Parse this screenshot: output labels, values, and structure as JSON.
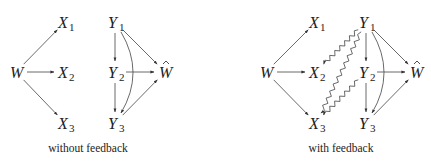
{
  "figure": {
    "panels": [
      {
        "id": "without-feedback",
        "caption": "without feedback",
        "caption_pos": [
          88,
          152
        ],
        "nodes": [
          {
            "id": "W",
            "base": "W",
            "sub": "",
            "hat": false,
            "x": 16,
            "y": 72
          },
          {
            "id": "X1",
            "base": "X",
            "sub": "1",
            "hat": false,
            "x": 65,
            "y": 22
          },
          {
            "id": "X2",
            "base": "X",
            "sub": "2",
            "hat": false,
            "x": 65,
            "y": 72
          },
          {
            "id": "X3",
            "base": "X",
            "sub": "3",
            "hat": false,
            "x": 65,
            "y": 123
          },
          {
            "id": "Y1",
            "base": "Y",
            "sub": "1",
            "hat": false,
            "x": 115,
            "y": 22
          },
          {
            "id": "Y2",
            "base": "Y",
            "sub": "2",
            "hat": false,
            "x": 115,
            "y": 72
          },
          {
            "id": "Y3",
            "base": "Y",
            "sub": "3",
            "hat": false,
            "x": 115,
            "y": 123
          },
          {
            "id": "What",
            "base": "W",
            "sub": "",
            "hat": true,
            "x": 165,
            "y": 72
          }
        ],
        "edges": [
          {
            "from": "W",
            "to": "X1",
            "style": "straight"
          },
          {
            "from": "W",
            "to": "X2",
            "style": "straight"
          },
          {
            "from": "W",
            "to": "X3",
            "style": "straight"
          },
          {
            "from": "Y1",
            "to": "Y2",
            "style": "straight"
          },
          {
            "from": "Y1",
            "to": "What",
            "style": "straight"
          },
          {
            "from": "Y1",
            "to": "Y3",
            "style": "curved"
          },
          {
            "from": "Y2",
            "to": "What",
            "style": "straight"
          },
          {
            "from": "Y2",
            "to": "Y3",
            "style": "straight"
          },
          {
            "from": "Y3",
            "to": "What",
            "style": "straight"
          }
        ]
      },
      {
        "id": "with-feedback",
        "caption": "with feedback",
        "caption_pos": [
          341,
          152
        ],
        "nodes": [
          {
            "id": "W",
            "base": "W",
            "sub": "",
            "hat": false,
            "x": 266,
            "y": 72
          },
          {
            "id": "X1",
            "base": "X",
            "sub": "1",
            "hat": false,
            "x": 316,
            "y": 22
          },
          {
            "id": "X2",
            "base": "X",
            "sub": "2",
            "hat": false,
            "x": 316,
            "y": 72
          },
          {
            "id": "X3",
            "base": "X",
            "sub": "3",
            "hat": false,
            "x": 316,
            "y": 123
          },
          {
            "id": "Y1",
            "base": "Y",
            "sub": "1",
            "hat": false,
            "x": 366,
            "y": 22
          },
          {
            "id": "Y2",
            "base": "Y",
            "sub": "2",
            "hat": false,
            "x": 366,
            "y": 72
          },
          {
            "id": "Y3",
            "base": "Y",
            "sub": "3",
            "hat": false,
            "x": 366,
            "y": 123
          },
          {
            "id": "What",
            "base": "W",
            "sub": "",
            "hat": true,
            "x": 416,
            "y": 72
          }
        ],
        "edges": [
          {
            "from": "W",
            "to": "X1",
            "style": "straight"
          },
          {
            "from": "W",
            "to": "X2",
            "style": "straight"
          },
          {
            "from": "W",
            "to": "X3",
            "style": "straight"
          },
          {
            "from": "Y1",
            "to": "Y2",
            "style": "straight"
          },
          {
            "from": "Y1",
            "to": "What",
            "style": "straight"
          },
          {
            "from": "Y1",
            "to": "Y3",
            "style": "curved"
          },
          {
            "from": "Y2",
            "to": "What",
            "style": "straight"
          },
          {
            "from": "Y2",
            "to": "Y3",
            "style": "straight"
          },
          {
            "from": "Y3",
            "to": "What",
            "style": "straight"
          },
          {
            "from": "Y1",
            "to": "X2",
            "style": "wavy"
          },
          {
            "from": "Y1",
            "to": "X3",
            "style": "wavy"
          },
          {
            "from": "Y2",
            "to": "X3",
            "style": "wavy"
          }
        ]
      }
    ],
    "colors": {
      "ink": "#222222",
      "edge": "#444444",
      "background": "#ffffff"
    }
  }
}
